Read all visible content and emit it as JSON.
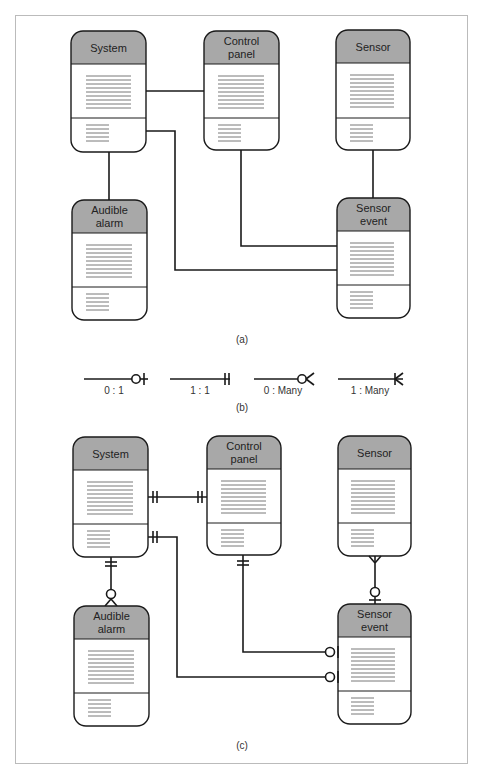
{
  "diagram": {
    "part_a": {
      "caption": "(a)",
      "entities": [
        {
          "id": "system",
          "label_lines": [
            "System"
          ]
        },
        {
          "id": "control_panel",
          "label_lines": [
            "Control",
            "panel"
          ]
        },
        {
          "id": "sensor",
          "label_lines": [
            "Sensor"
          ]
        },
        {
          "id": "audible_alarm",
          "label_lines": [
            "Audible",
            "alarm"
          ]
        },
        {
          "id": "sensor_event",
          "label_lines": [
            "Sensor",
            "event"
          ]
        }
      ],
      "relationships": [
        {
          "from": "system",
          "to": "control_panel"
        },
        {
          "from": "system",
          "to": "audible_alarm"
        },
        {
          "from": "system",
          "to": "sensor_event"
        },
        {
          "from": "control_panel",
          "to": "sensor_event"
        },
        {
          "from": "sensor",
          "to": "sensor_event"
        }
      ]
    },
    "part_b": {
      "caption": "(b)",
      "legend": [
        {
          "label": "0 : 1",
          "symbol": "zero-or-one"
        },
        {
          "label": "1 : 1",
          "symbol": "one-and-only-one"
        },
        {
          "label": "0 : Many",
          "symbol": "zero-or-many"
        },
        {
          "label": "1 : Many",
          "symbol": "one-or-many"
        }
      ]
    },
    "part_c": {
      "caption": "(c)",
      "entities": [
        {
          "id": "system",
          "label_lines": [
            "System"
          ]
        },
        {
          "id": "control_panel",
          "label_lines": [
            "Control",
            "panel"
          ]
        },
        {
          "id": "sensor",
          "label_lines": [
            "Sensor"
          ]
        },
        {
          "id": "audible_alarm",
          "label_lines": [
            "Audible",
            "alarm"
          ]
        },
        {
          "id": "sensor_event",
          "label_lines": [
            "Sensor",
            "event"
          ]
        }
      ],
      "relationships": [
        {
          "from": "system",
          "to": "control_panel",
          "cardinality": "1 : 1"
        },
        {
          "from": "system",
          "to": "audible_alarm",
          "cardinality": "1 : 0..Many"
        },
        {
          "from": "system",
          "to": "sensor_event",
          "cardinality": "1 : 0..1"
        },
        {
          "from": "control_panel",
          "to": "sensor_event",
          "cardinality": "1 : 0..1"
        },
        {
          "from": "sensor",
          "to": "sensor_event",
          "cardinality": "Many : 0..1"
        }
      ]
    },
    "colors": {
      "header_fill": "#a8a8a8",
      "stroke": "#1a1a1a",
      "text_lines": "#555555",
      "frame": "#bbbbbb"
    }
  }
}
